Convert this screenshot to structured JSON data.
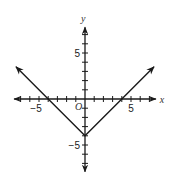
{
  "chart_data": {
    "type": "line",
    "title": "",
    "xlabel": "x",
    "ylabel": "y",
    "origin_label": "O",
    "xlim": [
      -7.7,
      7.7
    ],
    "ylim": [
      -7.9,
      7.8
    ],
    "x_ticks": [
      -7,
      -6,
      -5,
      -4,
      -3,
      -2,
      -1,
      1,
      2,
      3,
      4,
      5,
      6,
      7
    ],
    "y_ticks": [
      -7,
      -6,
      -5,
      -4,
      -3,
      -2,
      -1,
      1,
      2,
      3,
      4,
      5,
      6,
      7
    ],
    "x_tick_labels": [
      {
        "value": -5,
        "text": "−5"
      },
      {
        "value": 5,
        "text": "5"
      }
    ],
    "y_tick_labels": [
      {
        "value": 5,
        "text": "5"
      },
      {
        "value": -5,
        "text": "−5"
      }
    ],
    "grid": false,
    "series": [
      {
        "name": "y = |x| − 4",
        "x": [
          -7.5,
          -4,
          0,
          4,
          7.5
        ],
        "y": [
          3.5,
          0,
          -4,
          0,
          3.5
        ],
        "arrows_at_ends": true
      }
    ],
    "annotations": [
      "vertex at (0, −4)",
      "x-intercepts at (−4, 0) and (4, 0)"
    ]
  },
  "colors": {
    "axis": "#1a1a1a",
    "line": "#1a1a1a"
  }
}
